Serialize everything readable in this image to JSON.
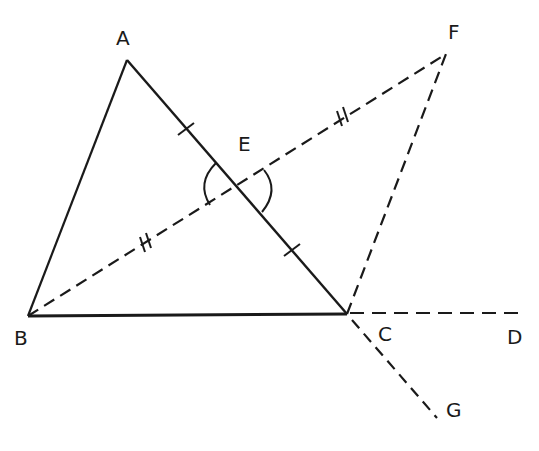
{
  "diagram": {
    "stroke_color": "#1a1a1a",
    "background": "#ffffff",
    "points": {
      "A": {
        "label": "A",
        "x": 127,
        "y": 60
      },
      "B": {
        "label": "B",
        "x": 28,
        "y": 316
      },
      "C": {
        "label": "C",
        "x": 347,
        "y": 314
      },
      "D": {
        "label": "D",
        "x": 522,
        "y": 313
      },
      "E": {
        "label": "E",
        "x": 237,
        "y": 185
      },
      "F": {
        "label": "F",
        "x": 446,
        "y": 54
      },
      "G": {
        "label": "G",
        "x": 437,
        "y": 418
      }
    },
    "solid_segments": [
      "AB",
      "AC",
      "BC"
    ],
    "dashed_segments": [
      "BF",
      "CF",
      "CD",
      "CG"
    ],
    "marks": {
      "single_tick": [
        "AE",
        "EC"
      ],
      "double_tick": [
        "BE",
        "EF"
      ],
      "equal_angles": [
        "AEB",
        "FEC"
      ]
    }
  }
}
